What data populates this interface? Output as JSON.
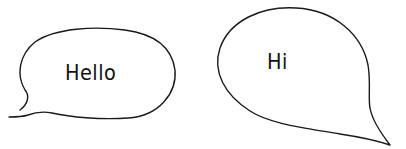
{
  "bubbles": [
    {
      "id": "left",
      "text": "Hello"
    },
    {
      "id": "right",
      "text": "Hi"
    }
  ],
  "colors": {
    "stroke": "#1a1a1a",
    "fill": "#ffffff",
    "text": "#111111",
    "background": "#ffffff"
  }
}
